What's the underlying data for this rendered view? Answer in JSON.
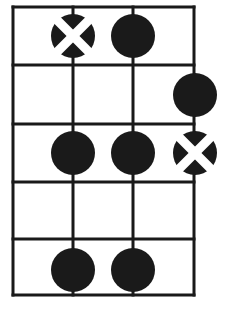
{
  "diagram": {
    "kind": "guitar-chord-fretboard-diagram",
    "title": "",
    "width": 228,
    "height": 313,
    "background_color": "#ffffff",
    "line_color": "#1a1a1a",
    "dot_fill_color": "#1a1a1a",
    "marker_color": "#ffffff",
    "line_width": 3,
    "dot_radius": 22,
    "grid": {
      "string_count": 4,
      "string_x": [
        13,
        73,
        133,
        194
      ],
      "fret_line_count": 6,
      "fret_line_y": [
        7,
        65,
        124,
        182,
        239,
        295
      ],
      "fret_space_count": 5,
      "fret_space_labels": [
        "1",
        "2",
        "3",
        "4",
        "5"
      ],
      "string_labels": [
        "1",
        "2",
        "3",
        "4"
      ]
    },
    "dots": [
      {
        "id": "dot-f1-s2",
        "fret": 1,
        "string": 2,
        "cx": 73,
        "cy": 36,
        "marker": "cross",
        "label": ""
      },
      {
        "id": "dot-f1-s3",
        "fret": 1,
        "string": 3,
        "cx": 133,
        "cy": 36,
        "marker": "none",
        "label": ""
      },
      {
        "id": "dot-f2-s4",
        "fret": 2,
        "string": 4,
        "cx": 195,
        "cy": 95,
        "marker": "none",
        "label": ""
      },
      {
        "id": "dot-f3-s2",
        "fret": 3,
        "string": 2,
        "cx": 73,
        "cy": 153,
        "marker": "none",
        "label": ""
      },
      {
        "id": "dot-f3-s3",
        "fret": 3,
        "string": 3,
        "cx": 133,
        "cy": 153,
        "marker": "none",
        "label": ""
      },
      {
        "id": "dot-f3-s4",
        "fret": 3,
        "string": 4,
        "cx": 195,
        "cy": 153,
        "marker": "cross",
        "label": ""
      },
      {
        "id": "dot-f5-s2",
        "fret": 5,
        "string": 2,
        "cx": 73,
        "cy": 270,
        "marker": "none",
        "label": ""
      },
      {
        "id": "dot-f5-s3",
        "fret": 5,
        "string": 3,
        "cx": 133,
        "cy": 270,
        "marker": "none",
        "label": ""
      }
    ]
  }
}
